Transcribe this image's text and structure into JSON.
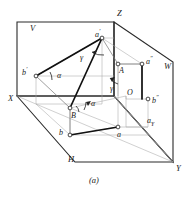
{
  "figure": {
    "caption": "(a)",
    "colors": {
      "ink": "#1a1a1a",
      "thick_line": "#111111",
      "thin_line": "#555555",
      "light_line": "#9a9a9a",
      "background": "#ffffff"
    },
    "planes": [
      {
        "id": "V",
        "label": "V",
        "x": 30,
        "y": 24,
        "meaning": "vertical-projection-plane"
      },
      {
        "id": "W",
        "label": "W",
        "x": 164,
        "y": 62,
        "meaning": "profile-projection-plane"
      },
      {
        "id": "H",
        "label": "H",
        "x": 68,
        "y": 155,
        "meaning": "horizontal-projection-plane"
      }
    ],
    "axes": [
      {
        "id": "X",
        "label": "X",
        "x": 8,
        "y": 94
      },
      {
        "id": "Y",
        "label": "Y",
        "x": 176,
        "y": 164
      },
      {
        "id": "Z",
        "label": "Z",
        "x": 117,
        "y": 9
      }
    ],
    "points": [
      {
        "id": "a-prime",
        "label": "a",
        "sup": "′",
        "x": 95,
        "y": 31,
        "note": "V-projection of A"
      },
      {
        "id": "b-prime",
        "label": "b",
        "sup": "′",
        "x": 29,
        "y": 69,
        "note": "V-projection of B"
      },
      {
        "id": "a-dprime",
        "label": "a",
        "sup": "″",
        "x": 146,
        "y": 64,
        "note": "W-projection of A"
      },
      {
        "id": "b-dprime",
        "label": "b",
        "sup": "″",
        "x": 150,
        "y": 104,
        "note": "W-projection of B"
      },
      {
        "id": "A",
        "label": "A",
        "sup": "",
        "x": 117,
        "y": 71,
        "note": "space point A"
      },
      {
        "id": "B",
        "label": "B",
        "sup": "",
        "x": 74,
        "y": 113,
        "note": "space point B"
      },
      {
        "id": "a",
        "label": "a",
        "sup": "",
        "x": 118,
        "y": 133,
        "note": "H-projection of A"
      },
      {
        "id": "b",
        "label": "b",
        "sup": "",
        "x": 62,
        "y": 131,
        "note": "H-projection of B"
      },
      {
        "id": "O",
        "label": "O",
        "sup": "",
        "x": 126,
        "y": 96,
        "note": "origin"
      },
      {
        "id": "a-y",
        "label": "a",
        "sub": "Y",
        "x": 148,
        "y": 122,
        "note": "Y-axis foot of A"
      }
    ],
    "angles": [
      {
        "id": "alpha-upper",
        "label": "α",
        "x": 57,
        "y": 76,
        "note": "angle at b' in V plane"
      },
      {
        "id": "alpha-lower",
        "label": "α",
        "x": 90,
        "y": 103,
        "note": "angle at B in H plane"
      },
      {
        "id": "gamma-upper",
        "label": "γ",
        "x": 81,
        "y": 53,
        "note": "angle at a'"
      },
      {
        "id": "gamma-lower",
        "label": "γ",
        "x": 112,
        "y": 86,
        "note": "angle at A"
      },
      {
        "id": "beta",
        "label": "β",
        "x": 74,
        "y": 113,
        "note": "angle at B"
      }
    ]
  }
}
